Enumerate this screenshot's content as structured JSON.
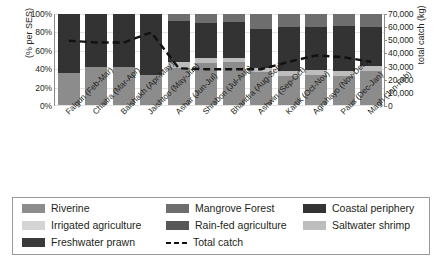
{
  "chart_data": {
    "type": "bar",
    "title": "",
    "subtitle": "",
    "stacked": true,
    "grid": true,
    "legend_position": "bottom",
    "xlabel": "",
    "ylabel": "(% per SES)",
    "y2label": "total catch (kg)",
    "ylim": [
      0,
      100
    ],
    "ytick_labels": [
      "100%",
      "80%",
      "60%",
      "40%",
      "20%",
      "0%"
    ],
    "ytick_values": [
      100,
      80,
      60,
      40,
      20,
      0
    ],
    "y2lim": [
      0,
      70000
    ],
    "y2tick_labels": [
      "70,000",
      "60,000",
      "50,000",
      "40,000",
      "30,000",
      "20,000",
      "10,000",
      "0"
    ],
    "y2tick_values": [
      70000,
      60000,
      50000,
      40000,
      30000,
      20000,
      10000,
      0
    ],
    "categories": [
      "Falgun (Feb-Mar)",
      "Chaitra (Mar-Apr)",
      "Baishakh (Apr-May)",
      "Jaishtoo (May-Jun)",
      "Ashar (Jun-Jul)",
      "Shrabon (Jul-Aug)",
      "Bhandra (Aug-Sep)",
      "Ashwin (Sep-Oct)",
      "Kartik (Oct-Nov)",
      "Agrahayo (Nov-Dec)",
      "Paus (Dec-Jan)",
      "Magh (Jan-Feb)"
    ],
    "series": [
      {
        "name": "Riverine",
        "color": "#8c8c8c",
        "values": [
          35,
          42,
          42,
          33,
          41,
          46,
          47,
          36,
          32,
          33,
          32,
          37
        ]
      },
      {
        "name": "Irrigated agriculture",
        "color": "#d4d4d4",
        "values": [
          0,
          0,
          0,
          0,
          0,
          0,
          0,
          0,
          0,
          0,
          0,
          0
        ]
      },
      {
        "name": "Freshwater prawn",
        "color": "#3a3a3a",
        "values": [
          0,
          0,
          0,
          0,
          0,
          0,
          0,
          0,
          0,
          0,
          0,
          0
        ]
      },
      {
        "name": "Mangrove Forest",
        "color": "#6e6e6e",
        "values": [
          0,
          0,
          0,
          0,
          8,
          10,
          9,
          16,
          14,
          14,
          13,
          14
        ]
      },
      {
        "name": "Rain-fed agriculture",
        "color": "#575757",
        "values": [
          0,
          0,
          0,
          0,
          0,
          0,
          0,
          0,
          0,
          0,
          0,
          0
        ]
      },
      {
        "name": "Saltwater shrimp",
        "color": "#bdbdbd",
        "values": [
          0,
          0,
          0,
          0,
          6,
          6,
          5,
          5,
          5,
          5,
          5,
          6
        ]
      },
      {
        "name": "Coastal periphery",
        "color": "#333333",
        "values": [
          65,
          58,
          58,
          67,
          45,
          38,
          39,
          43,
          49,
          48,
          50,
          43
        ]
      }
    ],
    "line_series": {
      "name": "Total catch",
      "style": "dashed",
      "color": "#111111",
      "axis": "y2",
      "values_percent": [
        71,
        69,
        69,
        80,
        41,
        40,
        40,
        40,
        48,
        55,
        53,
        48
      ],
      "values_kg": [
        49700,
        48300,
        48300,
        56000,
        28700,
        28000,
        28000,
        28000,
        33600,
        38500,
        37100,
        33600
      ]
    },
    "legend_items": [
      {
        "label": "Riverine",
        "color": "#8c8c8c",
        "type": "swatch"
      },
      {
        "label": "Mangrove Forest",
        "color": "#6e6e6e",
        "type": "swatch"
      },
      {
        "label": "Coastal periphery",
        "color": "#333333",
        "type": "swatch"
      },
      {
        "label": "Irrigated agriculture",
        "color": "#d4d4d4",
        "type": "swatch"
      },
      {
        "label": "Rain-fed agriculture",
        "color": "#575757",
        "type": "swatch"
      },
      {
        "label": "Saltwater shrimp",
        "color": "#bdbdbd",
        "type": "swatch"
      },
      {
        "label": "Freshwater prawn",
        "color": "#3a3a3a",
        "type": "swatch"
      },
      {
        "label": "Total catch",
        "color": "#111111",
        "type": "dashed-line"
      }
    ]
  }
}
